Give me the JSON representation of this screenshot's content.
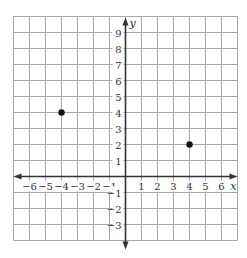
{
  "graph": {
    "x_axis_label": "x",
    "y_axis_label": "y",
    "x_range": [
      -6,
      6
    ],
    "y_range": [
      -3,
      9
    ],
    "x_ticks": [
      "−6",
      "−5",
      "−4",
      "−3",
      "−2",
      "−1",
      "1",
      "2",
      "3",
      "4",
      "5",
      "6"
    ],
    "y_ticks": [
      "9",
      "8",
      "7",
      "6",
      "5",
      "4",
      "3",
      "2",
      "1",
      "−1",
      "−2",
      "−3"
    ],
    "points": [
      {
        "x": -4,
        "y": 4
      },
      {
        "x": 4,
        "y": 2
      }
    ],
    "colors": {
      "grid": "#a8a8a8",
      "axis": "#333333",
      "point": "#111111"
    }
  }
}
